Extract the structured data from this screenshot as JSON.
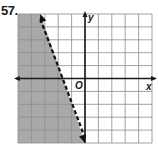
{
  "problem": {
    "number": "57."
  },
  "chart_data": {
    "type": "line",
    "title": "",
    "xlabel": "x",
    "ylabel": "y",
    "origin_label": "O",
    "xlim": [
      -5,
      5
    ],
    "ylim": [
      -5,
      5
    ],
    "grid": true,
    "grid_step": 1,
    "boundary_line": {
      "equation": "y = -3x - 5",
      "slope": -3,
      "intercept": -5,
      "style": "dashed",
      "arrows": "both",
      "points": [
        [
          -3.33,
          5
        ],
        [
          0,
          -5
        ]
      ]
    },
    "shaded_region": "left of line (y < -3x - 5)",
    "inequality": "y < -3x - 5",
    "colors": {
      "shade": "#a9a9a9",
      "grid": "#8c8c8c",
      "axis": "#1a1a1a",
      "line": "#111111"
    }
  }
}
